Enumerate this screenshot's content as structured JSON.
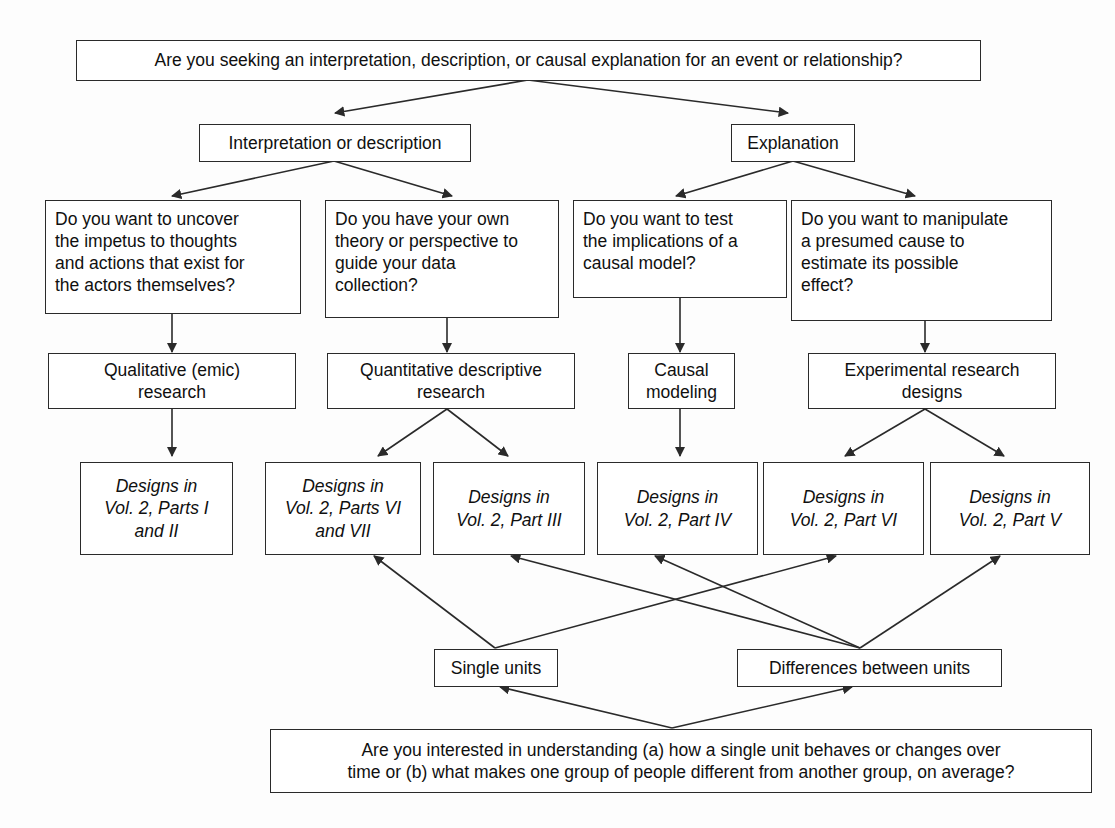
{
  "diagram": {
    "stroke_color": "#2a2a2a",
    "background_color": "#fdfdfd",
    "nodes": {
      "root_question": "Are you seeking an interpretation, description, or causal explanation for an event or relationship?",
      "branch_interpretation": "Interpretation or description",
      "branch_explanation": "Explanation",
      "q_emic": "Do you want to uncover the impetus to thoughts and actions that exist for the actors themselves?",
      "q_theory": "Do you have your own theory or perspective to guide your data collection?",
      "q_causal": "Do you want to test the implications of a causal model?",
      "q_manipulate": "Do you want to manipulate a presumed cause to estimate its possible effect?",
      "method_qualitative": "Qualitative (emic) research",
      "method_quantitative": "Quantitative descriptive research",
      "method_causal_modeling": "Causal modeling",
      "method_experimental": "Experimental research designs",
      "design_parts_i_ii": "Designs in Vol. 2, Parts I and II",
      "design_parts_vi_vii": "Designs in Vol. 2, Parts VI and VII",
      "design_part_iii": "Designs in Vol. 2, Part III",
      "design_part_iv": "Designs in Vol. 2, Part IV",
      "design_part_vi": "Designs in Vol. 2, Part VI",
      "design_part_v": "Designs in Vol. 2, Part V",
      "unit_single": "Single units",
      "unit_differences": "Differences between units",
      "bottom_question": "Are you interested in understanding (a) how a single unit behaves or changes over time or (b) what makes one group of people different from another group, on average?"
    },
    "node_lines": {
      "q_emic": [
        "Do you want to uncover",
        "the impetus to thoughts",
        "and actions that exist for",
        "the actors themselves?"
      ],
      "q_theory": [
        "Do you have your own",
        "theory or perspective to",
        "guide your data",
        "collection?"
      ],
      "q_causal": [
        "Do you want to test",
        "the implications of a",
        "causal model?"
      ],
      "q_manipulate": [
        "Do you want to manipulate",
        "a presumed cause to",
        "estimate its possible",
        "effect?"
      ],
      "method_qualitative": [
        "Qualitative (emic)",
        "research"
      ],
      "method_quantitative": [
        "Quantitative descriptive",
        "research"
      ],
      "method_causal_modeling": [
        "Causal",
        "modeling"
      ],
      "method_experimental": [
        "Experimental research",
        "designs"
      ],
      "design_parts_i_ii": [
        "Designs in",
        "Vol. 2, Parts I",
        "and II"
      ],
      "design_parts_vi_vii": [
        "Designs in",
        "Vol. 2, Parts VI",
        "and VII"
      ],
      "design_part_iii": [
        "Designs in",
        "Vol. 2, Part III"
      ],
      "design_part_iv": [
        "Designs in",
        "Vol. 2, Part IV"
      ],
      "design_part_vi": [
        "Designs in",
        "Vol. 2, Part VI"
      ],
      "design_part_v": [
        "Designs in",
        "Vol. 2, Part V"
      ],
      "bottom_question": [
        "Are you interested in understanding (a) how a single unit behaves or changes over",
        "time or (b) what makes one group of people different from another group, on average?"
      ]
    },
    "edges": [
      {
        "from": "root_question",
        "to": "branch_interpretation"
      },
      {
        "from": "root_question",
        "to": "branch_explanation"
      },
      {
        "from": "branch_interpretation",
        "to": "q_emic"
      },
      {
        "from": "branch_interpretation",
        "to": "q_theory"
      },
      {
        "from": "branch_explanation",
        "to": "q_causal"
      },
      {
        "from": "branch_explanation",
        "to": "q_manipulate"
      },
      {
        "from": "q_emic",
        "to": "method_qualitative"
      },
      {
        "from": "q_theory",
        "to": "method_quantitative"
      },
      {
        "from": "q_causal",
        "to": "method_causal_modeling"
      },
      {
        "from": "q_manipulate",
        "to": "method_experimental"
      },
      {
        "from": "method_qualitative",
        "to": "design_parts_i_ii"
      },
      {
        "from": "method_quantitative",
        "to": "design_parts_vi_vii"
      },
      {
        "from": "method_quantitative",
        "to": "design_part_iii"
      },
      {
        "from": "method_causal_modeling",
        "to": "design_part_iv"
      },
      {
        "from": "method_experimental",
        "to": "design_part_vi"
      },
      {
        "from": "method_experimental",
        "to": "design_part_v"
      },
      {
        "from": "unit_single",
        "to": "design_parts_vi_vii"
      },
      {
        "from": "unit_single",
        "to": "design_part_vi"
      },
      {
        "from": "unit_differences",
        "to": "design_part_iii"
      },
      {
        "from": "unit_differences",
        "to": "design_part_iv"
      },
      {
        "from": "unit_differences",
        "to": "design_part_v"
      },
      {
        "from": "bottom_question",
        "to": "unit_single"
      },
      {
        "from": "bottom_question",
        "to": "unit_differences"
      }
    ]
  }
}
